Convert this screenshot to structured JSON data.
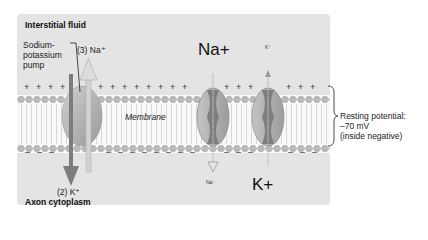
{
  "regions": {
    "top": "Interstitial fluid",
    "bottom": "Axon cytoplasm",
    "membrane": "Membrane"
  },
  "pump": {
    "label_line1": "Sodium-",
    "label_line2": "potassium",
    "label_line3": "pump",
    "na_out": "(3) Na⁺",
    "k_in": "(2) K⁺"
  },
  "channels": {
    "na_channel": {
      "top_label": "Na+",
      "bottom_label": "Na⁺",
      "direction": "inward"
    },
    "k_channel": {
      "top_label": "K⁺",
      "bottom_label": "K+",
      "direction": "outward"
    }
  },
  "charges": {
    "outside": "+",
    "inside": "–"
  },
  "annotation": {
    "line1": "Resting potential:",
    "line2": "–70 mV",
    "line3": "(inside negative)"
  },
  "colors": {
    "panel": "#e4e4e4",
    "protein": "#a9a9a9",
    "arrow_dark": "#7a7a7a",
    "arrow_light": "#c4c4c4"
  }
}
